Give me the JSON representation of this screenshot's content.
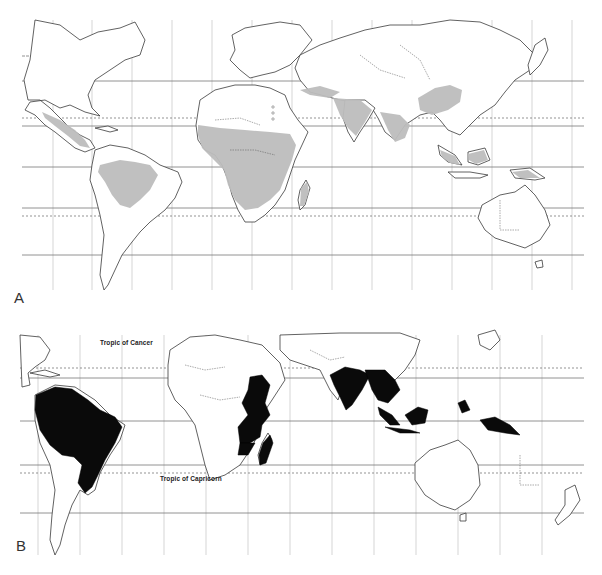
{
  "figure": {
    "panels": [
      {
        "id": "A",
        "label": "A",
        "style": "grey-shaded",
        "shade_color": "#bdbdbd",
        "shaded_regions": [
          "Mexico / Central America",
          "Amazon Basin (Northern South America)",
          "Sub-Saharan Africa (Sahel to Zambezi)",
          "Madagascar",
          "Arabian Peninsula margin / Middle East",
          "Indian Subcontinent",
          "Southern China",
          "Southeast Asia",
          "Indonesia / Borneo",
          "New Guinea"
        ]
      },
      {
        "id": "B",
        "label": "B",
        "style": "black-filled",
        "fill_color": "#0a0a0a",
        "filled_regions": [
          "Brazil / Amazon",
          "Sudan",
          "East Africa (Kenya, Uganda, Tanzania)",
          "Zambia",
          "Madagascar",
          "India",
          "Indochina (Myanmar, Thailand)",
          "Malay Peninsula",
          "Sumatra / Java",
          "Borneo",
          "Philippines",
          "New Guinea"
        ],
        "annotations": {
          "tropic_of_cancer": "Tropic of Cancer",
          "tropic_of_capricorn": "Tropic of Capricorn"
        }
      }
    ],
    "colors": {
      "background": "#ffffff",
      "outline": "#3a3a3a",
      "grid": "#b8b8b8"
    }
  }
}
